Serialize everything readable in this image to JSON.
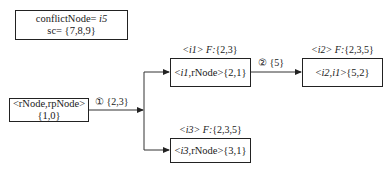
{
  "nodes": {
    "conflict": {
      "line1_prefix": "conflictNode= ",
      "line1_var": "i5",
      "line2": "sc= {7,8,9}"
    },
    "root": {
      "line1": "<rNode,rpNode>",
      "line2": "{1,0}"
    },
    "i1": {
      "header_id": "<i1>",
      "header_f": "F:",
      "header_set": "{2,3}",
      "body_prefix": "<",
      "body_var": "i1",
      "body_rest": ",rNode>{2,1}"
    },
    "i2": {
      "header_id": "<i2>",
      "header_f": "F:",
      "header_set": "{2,3,5}",
      "body_prefix": "<",
      "body_var": "i2,i1",
      "body_rest": ">{5,2}"
    },
    "i3": {
      "header_id": "<i3>",
      "header_f": "F:",
      "header_set": "{2,3,5}",
      "body_prefix": "<",
      "body_var": "i3",
      "body_rest": ",rNode>{3,1}"
    }
  },
  "edges": {
    "e1": {
      "step": "①",
      "set": "{2,3}"
    },
    "e2": {
      "step": "②",
      "set": "{5}"
    }
  }
}
